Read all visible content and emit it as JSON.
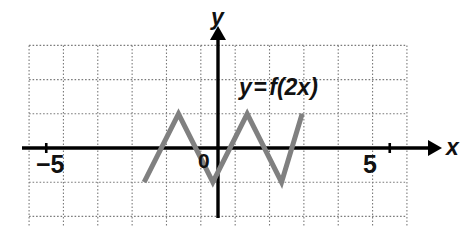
{
  "figure": {
    "kind": "cartesian-graph",
    "width": 468,
    "height": 227,
    "background": "#ffffff",
    "grid": {
      "visible": true,
      "style": "dotted",
      "color": "#777777",
      "x_min": -5.5,
      "x_max": 5.5,
      "y_min": -3.0,
      "y_max": 3.0,
      "x_step": 1,
      "y_step": 1
    },
    "axes": {
      "color": "#000000",
      "x_label": "x",
      "y_label": "y",
      "x_axis_arrow": true,
      "y_axis_arrow": true,
      "origin_label": "0",
      "x_ticks": [
        {
          "value": -5,
          "label": "−5"
        },
        {
          "value": 5,
          "label": "5"
        }
      ],
      "y_ticks": []
    },
    "annotations": [
      {
        "name": "equation-label",
        "text": "y = f(2x)",
        "x": 1.1,
        "y": 2.05
      }
    ],
    "curve": {
      "name": "f(2x)",
      "color": "#808080",
      "stroke_width": 5,
      "type": "sawtooth-zigzag",
      "points": [
        {
          "x": -2.15,
          "y": -1.0
        },
        {
          "x": -1.15,
          "y": 1.0
        },
        {
          "x": -0.15,
          "y": -1.0
        },
        {
          "x": 0.85,
          "y": 1.0
        },
        {
          "x": 1.85,
          "y": -1.0
        },
        {
          "x": 2.45,
          "y": 1.0
        }
      ]
    }
  },
  "labels": {
    "x_axis": "x",
    "y_axis": "y",
    "origin": "0",
    "neg_five": "−5",
    "pos_five": "5",
    "equation_lhs": "y",
    "equation_eq": "=",
    "equation_rhs": "f(2x)"
  },
  "chart_data": {
    "type": "line",
    "title": "",
    "subtitle": "",
    "xlabel": "x",
    "ylabel": "y",
    "xlim": [
      -5.5,
      5.5
    ],
    "ylim": [
      -3,
      3
    ],
    "grid": true,
    "legend": "none",
    "annotations": [
      "y = f(2x)"
    ],
    "xticks": [
      -5,
      5
    ],
    "xticklabels": [
      "−5",
      "5"
    ],
    "yticks": [],
    "yticklabels": [],
    "series": [
      {
        "name": "y = f(2x)",
        "color": "#808080",
        "x": [
          -2.15,
          -1.15,
          -0.15,
          0.85,
          1.85,
          2.45
        ],
        "y": [
          -1,
          1,
          -1,
          1,
          -1,
          1
        ]
      }
    ]
  }
}
